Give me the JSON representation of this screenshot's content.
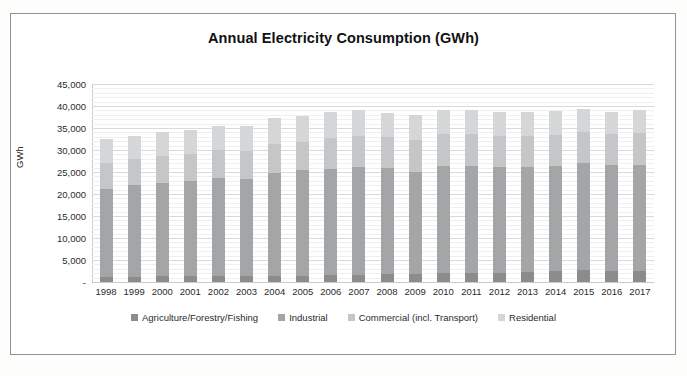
{
  "chart_data": {
    "type": "bar",
    "stacked": true,
    "title": "Annual Electricity Consumption (GWh)",
    "xlabel": "",
    "ylabel": "GWh",
    "ylim": [
      0,
      45000
    ],
    "ytick_labels": [
      "-",
      "5,000",
      "10,000",
      "15,000",
      "20,000",
      "25,000",
      "30,000",
      "35,000",
      "40,000",
      "45,000"
    ],
    "ytick_values": [
      0,
      5000,
      10000,
      15000,
      20000,
      25000,
      30000,
      35000,
      40000,
      45000
    ],
    "grid": true,
    "minor_grid": true,
    "legend_position": "bottom",
    "categories": [
      "1998",
      "1999",
      "2000",
      "2001",
      "2002",
      "2003",
      "2004",
      "2005",
      "2006",
      "2007",
      "2008",
      "2009",
      "2010",
      "2011",
      "2012",
      "2013",
      "2014",
      "2015",
      "2016",
      "2017"
    ],
    "series": [
      {
        "name": "Agriculture/Forestry/Fishing",
        "color": "#8a8c8e",
        "values": [
          1250,
          1250,
          1300,
          1300,
          1350,
          1350,
          1450,
          1450,
          1600,
          1700,
          1850,
          1850,
          1950,
          2000,
          2100,
          2200,
          2450,
          2700,
          2550,
          2600
        ]
      },
      {
        "name": "Industrial",
        "color": "#a3a5a7",
        "values": [
          19950,
          20750,
          21200,
          21550,
          22350,
          22000,
          23300,
          24000,
          24150,
          24550,
          24000,
          23250,
          24500,
          24350,
          24000,
          23900,
          23900,
          24300,
          23950,
          24100
        ]
      },
      {
        "name": "Commercial (incl. Transport)",
        "color": "#c4c6c7",
        "values": [
          5900,
          5950,
          6100,
          6250,
          6200,
          6500,
          6600,
          6400,
          6950,
          6950,
          7000,
          7100,
          7250,
          7200,
          7150,
          7150,
          7100,
          7100,
          7050,
          7150
        ]
      },
      {
        "name": "Residential",
        "color": "#d4d6d7",
        "values": [
          5300,
          5350,
          5500,
          5550,
          5600,
          5700,
          5850,
          5850,
          5900,
          5950,
          5550,
          5650,
          5450,
          5500,
          5450,
          5350,
          5400,
          5300,
          5200,
          5200
        ]
      }
    ],
    "totals": [
      32400,
      33300,
      34100,
      34650,
      35500,
      35550,
      37200,
      37700,
      38600,
      39150,
      38400,
      37850,
      39150,
      39050,
      38700,
      38600,
      38850,
      39400,
      38750,
      39050
    ]
  },
  "legend": {
    "items": [
      {
        "label": "Agriculture/Forestry/Fishing"
      },
      {
        "label": "Industrial"
      },
      {
        "label": "Commercial (incl. Transport)"
      },
      {
        "label": "Residential"
      }
    ]
  }
}
